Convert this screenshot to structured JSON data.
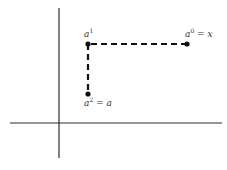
{
  "diagram": {
    "axes": {
      "vertical": {
        "x": 59,
        "y1": 8,
        "y2": 158
      },
      "horizontal": {
        "y": 123,
        "x1": 10,
        "x2": 222
      }
    },
    "points": [
      {
        "id": "a1",
        "x": 88,
        "y": 44,
        "label": {
          "base": "a",
          "sup": "1",
          "suffix": ""
        },
        "label_pos": {
          "x": 84,
          "y": 37
        }
      },
      {
        "id": "a0",
        "x": 187,
        "y": 44,
        "label": {
          "base": "a",
          "sup": "0",
          "suffix": " = x"
        },
        "label_pos": {
          "x": 185,
          "y": 37
        }
      },
      {
        "id": "a2",
        "x": 88,
        "y": 94,
        "label": {
          "base": "a",
          "sup": "2",
          "suffix": " = a"
        },
        "label_pos": {
          "x": 84,
          "y": 106
        }
      }
    ],
    "dashed_path": [
      {
        "from": "a0",
        "to": "a1"
      },
      {
        "from": "a1",
        "to": "a2"
      }
    ],
    "colors": {
      "axis": "#2a2a2a",
      "path": "#111111",
      "label": "#333333",
      "background": "#ffffff"
    }
  }
}
